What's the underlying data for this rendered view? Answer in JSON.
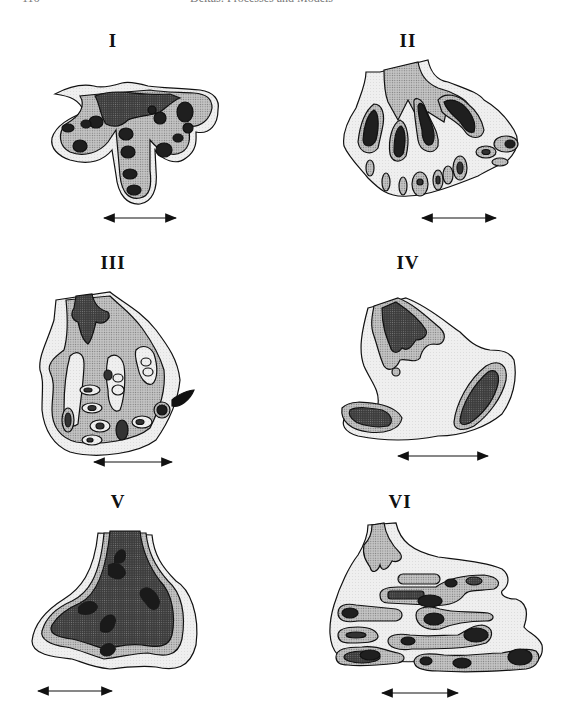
{
  "running_head": {
    "page_number": "116",
    "title": "Deltas: Processes and Models"
  },
  "figure": {
    "panels": [
      {
        "id": "I",
        "label": "I"
      },
      {
        "id": "II",
        "label": "II"
      },
      {
        "id": "III",
        "label": "III"
      },
      {
        "id": "IV",
        "label": "IV"
      },
      {
        "id": "V",
        "label": "V"
      },
      {
        "id": "VI",
        "label": "VI"
      }
    ],
    "legend_fills": {
      "outer": "#ececec",
      "middle": "#b9b9b9",
      "inner": "#4a4a4a",
      "core": "#1c1c1c"
    },
    "scale_bar": "double-headed arrow beneath each panel"
  }
}
